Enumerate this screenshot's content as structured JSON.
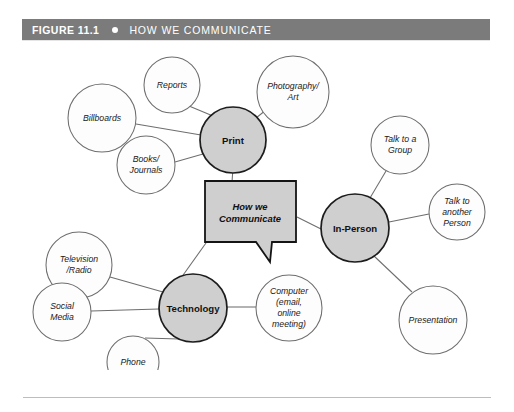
{
  "header": {
    "figure_label": "FIGURE 11.1",
    "bullet_icon": "filled-circle-icon",
    "title": "HOW WE COMMUNICATE",
    "bar_color": "#7b7b7b",
    "text_color": "#ffffff"
  },
  "diagram": {
    "type": "mind-map",
    "center": {
      "label_lines": [
        "How we",
        "Communicate"
      ],
      "shape": "speech-bubble",
      "fill": "#cfcfcf",
      "stroke": "#141414",
      "x": 250,
      "y": 175
    },
    "hubs": [
      {
        "id": "print",
        "label": "Print",
        "x": 233,
        "y": 100,
        "r": 33,
        "fill": "#cfcfcf",
        "leaves": [
          {
            "id": "billboards",
            "label_lines": [
              "Billboards"
            ],
            "x": 102,
            "y": 78,
            "r": 34
          },
          {
            "id": "reports",
            "label_lines": [
              "Reports"
            ],
            "x": 172,
            "y": 45,
            "r": 28
          },
          {
            "id": "photography-art",
            "label_lines": [
              "Photography/",
              "Art"
            ],
            "x": 293,
            "y": 52,
            "r": 36
          },
          {
            "id": "books-journals",
            "label_lines": [
              "Books/",
              "Journals"
            ],
            "x": 146,
            "y": 125,
            "r": 29
          }
        ]
      },
      {
        "id": "in-person",
        "label": "In-Person",
        "x": 355,
        "y": 188,
        "r": 34,
        "fill": "#cfcfcf",
        "leaves": [
          {
            "id": "talk-to-a-group",
            "label_lines": [
              "Talk to a",
              "Group"
            ],
            "x": 400,
            "y": 105,
            "r": 29
          },
          {
            "id": "talk-to-another-person",
            "label_lines": [
              "Talk to",
              "another",
              "Person"
            ],
            "x": 457,
            "y": 172,
            "r": 28
          },
          {
            "id": "presentation",
            "label_lines": [
              "Presentation"
            ],
            "x": 433,
            "y": 280,
            "r": 34
          }
        ]
      },
      {
        "id": "technology",
        "label": "Technology",
        "x": 193,
        "y": 268,
        "r": 34,
        "fill": "#cfcfcf",
        "leaves": [
          {
            "id": "television-radio",
            "label_lines": [
              "Television",
              "/Radio"
            ],
            "x": 79,
            "y": 225,
            "r": 33
          },
          {
            "id": "social-media",
            "label_lines": [
              "Social",
              "Media"
            ],
            "x": 62,
            "y": 272,
            "r": 29
          },
          {
            "id": "phone",
            "label_lines": [
              "Phone"
            ],
            "x": 133,
            "y": 322,
            "r": 26
          },
          {
            "id": "computer",
            "label_lines": [
              "Computer",
              "(email,",
              "online",
              "meeting)"
            ],
            "x": 289,
            "y": 268,
            "r": 33
          }
        ]
      }
    ]
  },
  "footer": {
    "rule_color": "#bdbdbd"
  }
}
